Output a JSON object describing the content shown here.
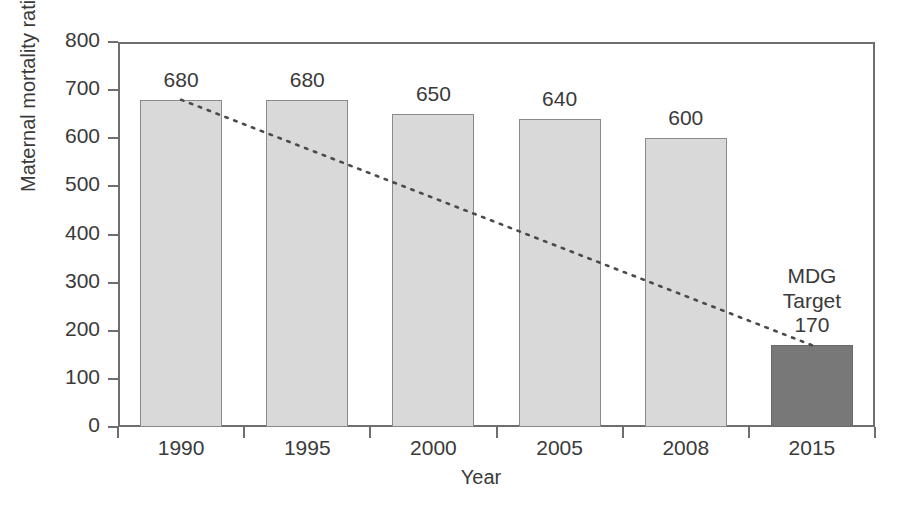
{
  "chart_data": {
    "type": "bar",
    "title": "",
    "subtitle": "",
    "xlabel": "Year",
    "ylabel": "Maternal mortality ratio (MMR)",
    "categories": [
      "1990",
      "1995",
      "2000",
      "2005",
      "2008",
      "2015"
    ],
    "values": [
      680,
      680,
      650,
      640,
      600,
      170
    ],
    "value_labels": [
      "680",
      "680",
      "650",
      "640",
      "600",
      "170"
    ],
    "ylim": [
      0,
      800
    ],
    "yticks": [
      0,
      100,
      200,
      300,
      400,
      500,
      600,
      700,
      800
    ],
    "ytick_labels": [
      "0",
      "100",
      "200",
      "300",
      "400",
      "500",
      "600",
      "700",
      "800"
    ],
    "grid": false,
    "legend": null,
    "series": [
      {
        "name": "Maternal mortality ratio",
        "values": [
          680,
          680,
          650,
          640,
          600,
          170
        ]
      }
    ],
    "bar_colors": [
      "#d9d9d9",
      "#d9d9d9",
      "#d9d9d9",
      "#d9d9d9",
      "#d9d9d9",
      "#787878"
    ],
    "annotations": [
      {
        "name": "mdg-target-annotation",
        "text_line1": "MDG",
        "text_line2": "Target",
        "category": "2015",
        "value": 170
      }
    ],
    "trendline": {
      "style": "dotted",
      "color": "#4a4a4a",
      "from": {
        "category": "1990",
        "value": 680
      },
      "to": {
        "category": "2015",
        "value": 170
      }
    }
  },
  "axis": {
    "y_title": "Maternal mortality ratio (MMR)",
    "x_title": "Year"
  },
  "colors": {
    "bar_light": "#d9d9d9",
    "bar_dark": "#787878",
    "axis": "#6e6e6e",
    "text": "#3a3a3a",
    "trend": "#4a4a4a"
  }
}
